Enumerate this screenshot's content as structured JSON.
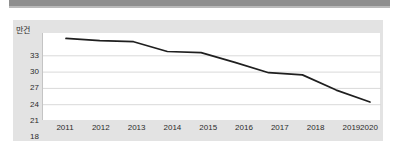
{
  "chart_data": {
    "type": "line",
    "title": "",
    "subtitle": "",
    "xlabel": "",
    "ylabel": "만건",
    "unit_label": "만건",
    "categories": [
      "2011",
      "2012",
      "2013",
      "2014",
      "2015",
      "2016",
      "2017",
      "2018",
      "2019",
      "2020"
    ],
    "x": [
      2011,
      2012,
      2013,
      2014,
      2015,
      2016,
      2017,
      2018,
      2019,
      2020
    ],
    "values": [
      33.0,
      32.6,
      32.4,
      30.6,
      30.4,
      28.6,
      26.7,
      26.3,
      23.5,
      21.3
    ],
    "series": [
      {
        "name": "",
        "values": [
          33.0,
          32.6,
          32.4,
          30.6,
          30.4,
          28.6,
          26.7,
          26.3,
          23.5,
          21.3
        ]
      }
    ],
    "ylim": [
      18,
      34
    ],
    "yticks": [
      33,
      30,
      27,
      24,
      21,
      18
    ],
    "ytick_labels": [
      "33",
      "30",
      "27",
      "24",
      "21",
      "18"
    ],
    "xtick_labels": [
      "2011",
      "2012",
      "2013",
      "2014",
      "2015",
      "2016",
      "2017",
      "2018",
      "2019",
      "2020"
    ],
    "grid": true,
    "grid_axis": "y",
    "legend": false,
    "legend_position": "none",
    "line_color": "#1f1f1f",
    "line_width": 1.6,
    "markers": false,
    "plot_background": "#ffffff",
    "panel_background": "#e3e3e3",
    "grid_color": "#d9d9d9",
    "axis_color": "#c4c4c4",
    "text_color": "#2b2b2b",
    "annotations": []
  },
  "decor": {
    "top_bar_color": "#8e8e8e",
    "top_bar_shadow_color": "#b9b9b9"
  }
}
